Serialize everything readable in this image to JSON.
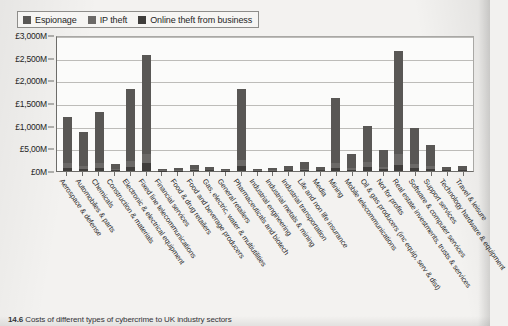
{
  "legend": {
    "items": [
      {
        "label": "Espionage",
        "color": "#595755"
      },
      {
        "label": "IP theft",
        "color": "#6b6967"
      },
      {
        "label": "Online theft from business",
        "color": "#3f3d3b"
      }
    ]
  },
  "caption": {
    "number": "14.6",
    "text": "Costs of different types of cybercrime to UK industry sectors"
  },
  "chart_data": {
    "type": "bar",
    "stacked": true,
    "title": "",
    "xlabel": "",
    "ylabel": "",
    "ylim": [
      0,
      3000
    ],
    "grid": true,
    "legend_position": "top-left",
    "ytick_labels": [
      "£3,000M",
      "£2,500M",
      "£2,000M",
      "£1,500M",
      "£1,000M",
      "£5,00M",
      "£0M"
    ],
    "ytick_values": [
      3000,
      2500,
      2000,
      1500,
      1000,
      500,
      0
    ],
    "units": "£ millions",
    "categories": [
      "Aerospace & defense",
      "Automobiles & parts",
      "Chemicals",
      "Construction & materials",
      "Electronic & electrical equipment",
      "Fixed line telecommunications",
      "Financial services",
      "Food & drug retailers",
      "Food and beverage producers",
      "Gas, electric, water & multiutilities",
      "General retailers",
      "Pharmaceuticals and biotech",
      "Industrial engineering",
      "Industrial metals & mining",
      "Industrial transportation",
      "Life and non life insurance",
      "Media",
      "Mining",
      "Mobile telecommunications",
      "Oil & gas producers (inc equip, serv & dist)",
      "Not for profits",
      "Real estate investments, trusts & services",
      "Software & computer services",
      "Support services",
      "Technology hardware & equipment",
      "Travel & leisure"
    ],
    "series": [
      {
        "name": "Espionage",
        "values": [
          1020,
          740,
          1130,
          110,
          1580,
          2180,
          30,
          45,
          90,
          60,
          20,
          1580,
          30,
          45,
          70,
          150,
          60,
          1430,
          300,
          800,
          370,
          2280,
          790,
          480,
          60,
          70
        ]
      },
      {
        "name": "IP theft",
        "values": [
          110,
          60,
          110,
          25,
          130,
          190,
          10,
          10,
          20,
          15,
          5,
          140,
          10,
          10,
          15,
          30,
          15,
          110,
          40,
          110,
          50,
          230,
          90,
          60,
          15,
          15
        ]
      },
      {
        "name": "Online theft from business",
        "values": [
          70,
          50,
          60,
          15,
          90,
          180,
          10,
          10,
          15,
          15,
          5,
          100,
          10,
          10,
          15,
          20,
          15,
          60,
          30,
          90,
          40,
          140,
          70,
          40,
          15,
          15
        ]
      }
    ],
    "totals": [
      1200,
      850,
      1300,
      150,
      1800,
      2450,
      50,
      65,
      125,
      90,
      30,
      1820,
      50,
      65,
      100,
      200,
      90,
      1600,
      370,
      1000,
      460,
      2650,
      950,
      580,
      90,
      100
    ]
  }
}
